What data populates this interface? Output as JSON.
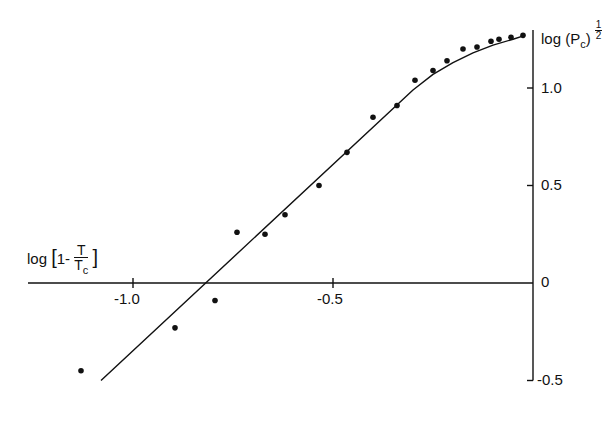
{
  "chart_data": {
    "type": "scatter",
    "title": "",
    "xlabel": "log [1 - T/Tc]",
    "ylabel": "log (Pc)^1/2",
    "xlabel_parts": {
      "prefix": "log [1-",
      "num": "T",
      "den_main": "T",
      "den_sub": "c",
      "suffix": "]"
    },
    "ylabel_parts": {
      "prefix": "log (P",
      "sub": "c",
      "suffix": ")",
      "exp": "1/2"
    },
    "xlim": [
      -1.33,
      0.0
    ],
    "ylim": [
      -0.5,
      1.3
    ],
    "x_ticks": [
      -1.0,
      -0.5
    ],
    "x_tick_labels": [
      "-1.0",
      "-0.5"
    ],
    "y_ticks": [
      1.0,
      0.5,
      0,
      -0.5
    ],
    "y_tick_labels": [
      "1.0",
      "0.5",
      "0",
      "-0.5"
    ],
    "grid": false,
    "legend": null,
    "series": [
      {
        "name": "data points",
        "x": [
          -1.13,
          -0.895,
          -0.795,
          -0.74,
          -0.67,
          -0.62,
          -0.535,
          -0.465,
          -0.4,
          -0.34,
          -0.295,
          -0.25,
          -0.215,
          -0.175,
          -0.14,
          -0.105,
          -0.085,
          -0.055,
          -0.025
        ],
        "y": [
          -0.45,
          -0.23,
          -0.09,
          0.26,
          0.25,
          0.35,
          0.5,
          0.67,
          0.85,
          0.91,
          1.04,
          1.09,
          1.14,
          1.2,
          1.21,
          1.24,
          1.25,
          1.26,
          1.27
        ]
      },
      {
        "name": "fit curve",
        "style": "line",
        "x": [
          -1.08,
          -0.3,
          -0.25,
          -0.2,
          -0.15,
          -0.1,
          -0.05,
          -0.02
        ],
        "y": [
          -0.5,
          0.99,
          1.07,
          1.13,
          1.18,
          1.22,
          1.25,
          1.27
        ]
      }
    ]
  },
  "labels": {
    "x_prefix": "log",
    "x_bracket_open": "[1-",
    "x_num": "T",
    "x_den": "T",
    "x_den_sub": "c",
    "x_bracket_close": "]",
    "y_prefix": "log (P",
    "y_sub": "c",
    "y_close": ")",
    "y_exp_num": "1",
    "y_exp_den": "2",
    "tick_x_m1": "-1.0",
    "tick_x_m05": "-0.5",
    "tick_y_1": "1.0",
    "tick_y_05": "0.5",
    "tick_y_0": "0",
    "tick_y_m05": "-0.5"
  }
}
